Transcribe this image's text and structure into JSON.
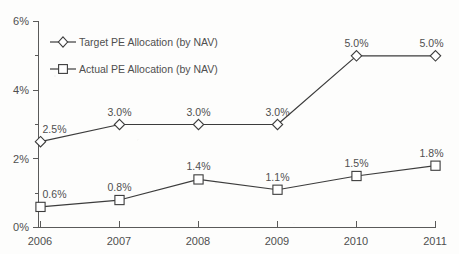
{
  "chart_data": {
    "type": "line",
    "title": "Target versus Actual Private Equity Allocation",
    "title_clipped": true,
    "xlabel": "",
    "ylabel": "",
    "categories": [
      "2006",
      "2007",
      "2008",
      "2009",
      "2010",
      "2011"
    ],
    "x_tick_labels": [
      "2006",
      "2007",
      "2008",
      "2009",
      "2010",
      "2011"
    ],
    "y_tick_labels": [
      "0%",
      "2%",
      "4%",
      "6%"
    ],
    "y_tick_values": [
      0,
      2,
      4,
      6
    ],
    "y_minor_tick_values": [
      1,
      3,
      5
    ],
    "ylim": [
      0,
      6
    ],
    "grid": false,
    "legend_position": "upper-left",
    "series": [
      {
        "name": "Target PE Allocation (by NAV)",
        "marker": "diamond",
        "values": [
          2.5,
          3.0,
          3.0,
          3.0,
          5.0,
          5.0
        ],
        "data_labels": [
          "2.5%",
          "3.0%",
          "3.0%",
          "3.0%",
          "5.0%",
          "5.0%"
        ]
      },
      {
        "name": "Actual PE Allocation (by NAV)",
        "marker": "square",
        "values": [
          0.6,
          0.8,
          1.4,
          1.1,
          1.5,
          1.8
        ],
        "data_labels": [
          "0.6%",
          "0.8%",
          "1.4%",
          "1.1%",
          "1.5%",
          "1.8%"
        ]
      }
    ],
    "colors": {
      "line": "#3c3c3c",
      "marker_fill": "#ffffff",
      "text": "#4f4f4f",
      "axis": "#5a5a5a",
      "background": "#fdfdfc"
    }
  }
}
